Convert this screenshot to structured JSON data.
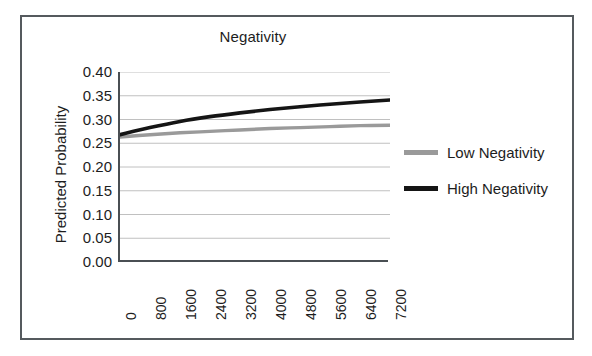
{
  "chart_data": {
    "type": "line",
    "title": "Negativity",
    "xlabel": "",
    "ylabel": "Predicted Probability",
    "ylim": [
      0.0,
      0.4
    ],
    "xlim": [
      0,
      7200
    ],
    "grid": true,
    "legend_position": "right",
    "y_ticks": [
      "0.40",
      "0.35",
      "0.30",
      "0.25",
      "0.20",
      "0.15",
      "0.10",
      "0.05",
      "0.00"
    ],
    "y_tick_values": [
      0.4,
      0.35,
      0.3,
      0.25,
      0.2,
      0.15,
      0.1,
      0.05,
      0.0
    ],
    "categories": [
      "0",
      "800",
      "1600",
      "2400",
      "3200",
      "4000",
      "4800",
      "5600",
      "6400",
      "7200"
    ],
    "x": [
      0,
      800,
      1600,
      2400,
      3200,
      4000,
      4800,
      5600,
      6400,
      7200
    ],
    "series": [
      {
        "name": "Low Negativity",
        "color": "#9a9a9a",
        "values": [
          0.263,
          0.268,
          0.272,
          0.275,
          0.278,
          0.281,
          0.283,
          0.285,
          0.287,
          0.288
        ]
      },
      {
        "name": "High Negativity",
        "color": "#151515",
        "values": [
          0.268,
          0.283,
          0.296,
          0.306,
          0.314,
          0.321,
          0.327,
          0.332,
          0.337,
          0.341
        ]
      }
    ]
  },
  "chart": {
    "title": "Negativity",
    "y_axis_title": "Predicted Probability"
  },
  "legend": {
    "items": [
      {
        "label": "Low Negativity",
        "color": "#9a9a9a"
      },
      {
        "label": "High Negativity",
        "color": "#151515"
      }
    ]
  }
}
